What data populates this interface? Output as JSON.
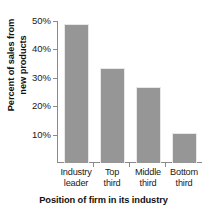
{
  "chart_data": {
    "type": "bar",
    "title": "",
    "xlabel": "Position of firm in its industry",
    "ylabel": "Percent of sales from new products",
    "categories": [
      "Industry leader",
      "Top third",
      "Middle third",
      "Bottom third"
    ],
    "values": [
      49,
      33.5,
      26.7,
      10.5
    ],
    "ylim": [
      0,
      50
    ],
    "yticks": [
      10,
      20,
      30,
      40,
      50
    ],
    "ytick_labels": [
      "10%",
      "20%",
      "30%",
      "40%",
      "50%"
    ],
    "grid": false,
    "legend": null,
    "bar_color": "#969696",
    "axis_color": "#8a8a8a"
  },
  "axes": {
    "y_title_line1": "Percent of sales from",
    "y_title_line2": "new products",
    "x_title": "Position of firm in its industry",
    "y_labels": [
      "50%",
      "40%",
      "30%",
      "20%",
      "10%"
    ],
    "x_categories": [
      {
        "line1": "Industry",
        "line2": "leader"
      },
      {
        "line1": "Top",
        "line2": "third"
      },
      {
        "line1": "Middle",
        "line2": "third"
      },
      {
        "line1": "Bottom",
        "line2": "third"
      }
    ]
  }
}
